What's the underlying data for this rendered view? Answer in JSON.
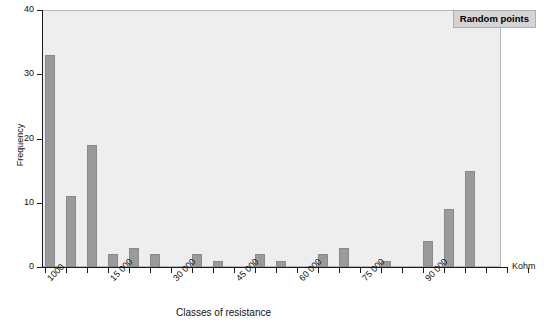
{
  "chart_data": {
    "type": "bar",
    "title": "",
    "xlabel": "Classes of resistance",
    "ylabel": "Frequency",
    "x_unit_label": "Kohm",
    "legend": {
      "position": "top-right",
      "entries": [
        "Random points"
      ]
    },
    "ylim": [
      0,
      40
    ],
    "ytick_labels": [
      "0",
      "10",
      "20",
      "30",
      "40"
    ],
    "ytick_values": [
      0,
      10,
      20,
      30,
      40
    ],
    "grid": false,
    "xtick_labels": [
      "1000",
      "15 000",
      "30 000",
      "45 000",
      "60 000",
      "75 000",
      "90 000"
    ],
    "xtick_values": [
      1000,
      15000,
      30000,
      45000,
      60000,
      75000,
      90000
    ],
    "categories": [
      "1000",
      "6000",
      "11000",
      "16000",
      "21000",
      "26000",
      "31000",
      "36000",
      "41000",
      "46000",
      "51000",
      "56000",
      "61000",
      "66000",
      "71000",
      "76000",
      "81000",
      "86000",
      "91000",
      "96000",
      "101000"
    ],
    "values": [
      33,
      11,
      19,
      2,
      3,
      2,
      0,
      2,
      1,
      0,
      2,
      1,
      0,
      2,
      3,
      0,
      1,
      0,
      4,
      9,
      15
    ],
    "bar_color": "#9a9a9a",
    "plot_background": "#eeeeee",
    "axis_color": "#1a1a1a"
  },
  "axes": {
    "y_title": "Frequency",
    "x_title": "Classes of resistance",
    "unit": "Kohm"
  },
  "legend": {
    "label": "Random points"
  }
}
